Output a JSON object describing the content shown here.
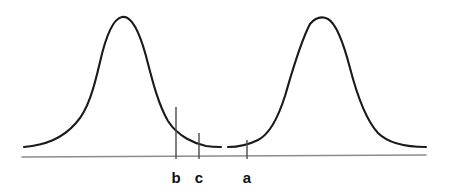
{
  "figure": {
    "width": 451,
    "height": 195,
    "background": "#ffffff",
    "curve_color": "#1a1a1a",
    "curve_width": 2.1,
    "axis_color": "#8c8c8c",
    "axis_width": 1.6,
    "tick_color": "#4a4a4a",
    "tick_width": 1.4,
    "label_color": "#111111"
  },
  "chart_data": {
    "type": "line",
    "title": "",
    "subtitle": "",
    "xlabel": "",
    "ylabel": "",
    "grid": false,
    "legend": null,
    "xlim": [
      0,
      451
    ],
    "ylim": [
      0,
      195
    ],
    "axis": {
      "name": "baseline-axis",
      "x_start": 22,
      "x_end": 426,
      "y_start": 157,
      "y_end": 155
    },
    "series": [
      {
        "name": "left-bell-curve",
        "peak_x": 122,
        "peak_y": 17,
        "baseline_y": 147,
        "x_start": 24,
        "x_end": 221,
        "path": "M 24,147 C 45,145 62,139 76,123 C 88,110 94,88 100,62 C 105,40 112,19 122,17 C 132,15 140,34 146,56 C 152,79 158,104 168,121 C 178,137 196,144 206,146 C 212,147 217,147 221,147"
      },
      {
        "name": "right-bell-curve",
        "peak_x": 323,
        "peak_y": 17,
        "baseline_y": 147,
        "x_start": 228,
        "x_end": 426,
        "path": "M 228,147 C 236,147 248,145 258,140 C 270,134 278,118 285,96 C 292,72 300,43 310,24 C 316,17 322,16 328,19 C 337,24 344,45 350,68 C 357,95 366,120 378,133 C 390,145 410,147 426,147"
      }
    ],
    "curve_gap": {
      "name": "valley-gap",
      "x_from": 221,
      "x_to": 228,
      "y": 147
    },
    "reference_lines": [
      {
        "label": "b",
        "x": 176,
        "y_top": 107,
        "y_bottom": 159,
        "label_x": 176,
        "label_y": 170
      },
      {
        "label": "c",
        "x": 199,
        "y_top": 133,
        "y_bottom": 159,
        "label_x": 199,
        "label_y": 170
      },
      {
        "label": "a",
        "x": 247,
        "y_top": 140,
        "y_bottom": 159,
        "label_x": 247,
        "label_y": 170
      }
    ]
  }
}
